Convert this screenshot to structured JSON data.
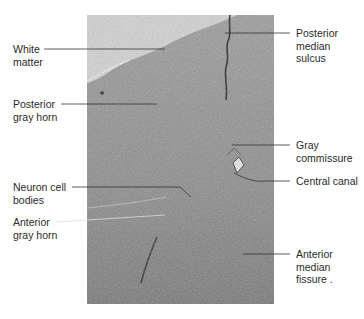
{
  "figure": {
    "colors": {
      "background": "#ffffff",
      "tissue": "#8f8f8f",
      "tissue_dark": "#6e6e6e",
      "empty_area": "#d3d3d3",
      "label_text": "#2a2a2a",
      "leader_line": "#333333"
    },
    "labels_left": [
      {
        "id": "white-matter",
        "text": "White\nmatter"
      },
      {
        "id": "posterior-gray-horn",
        "text": "Posterior\ngray horn"
      },
      {
        "id": "neuron-cell-bodies",
        "text": "Neuron cell\nbodies"
      },
      {
        "id": "anterior-gray-horn",
        "text": "Anterior\ngray horn"
      }
    ],
    "labels_right": [
      {
        "id": "posterior-median-sulcus",
        "text": "Posterior\nmedian\nsulcus"
      },
      {
        "id": "gray-commissure",
        "text": "Gray\ncommissure"
      },
      {
        "id": "central-canal",
        "text": "Central canal"
      },
      {
        "id": "anterior-median-fissure",
        "text": "Anterior\nmedian\nfissure ."
      }
    ]
  }
}
